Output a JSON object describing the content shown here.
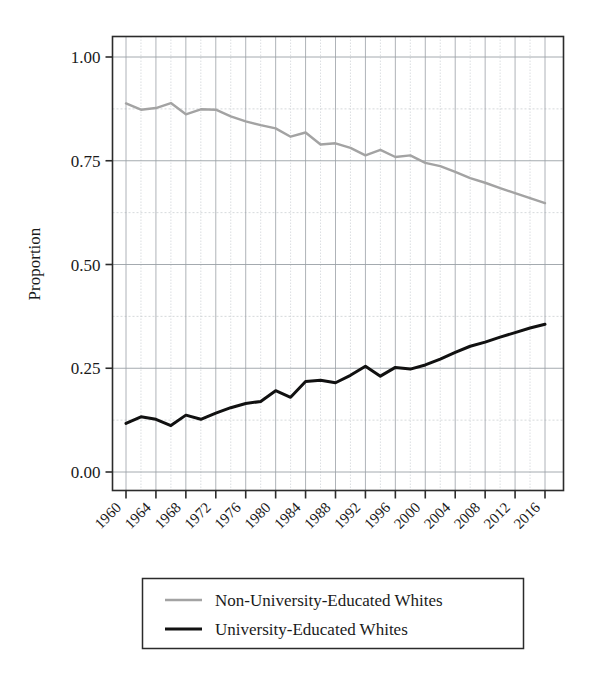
{
  "chart_data": {
    "type": "line",
    "title": "",
    "subtitle": "",
    "xlabel": "",
    "ylabel": "Proportion",
    "xlim": [
      1960,
      2016
    ],
    "ylim": [
      0.0,
      1.0
    ],
    "grid": true,
    "grid_major_y": [
      0.0,
      0.25,
      0.5,
      0.75,
      1.0
    ],
    "grid_minor_y": [
      0.125,
      0.375,
      0.625,
      0.875
    ],
    "grid_minor_x_step": 2,
    "legend_position": "bottom",
    "x": [
      1960,
      1962,
      1964,
      1966,
      1968,
      1970,
      1972,
      1974,
      1976,
      1978,
      1980,
      1982,
      1984,
      1986,
      1988,
      1990,
      1992,
      1994,
      1996,
      1998,
      2000,
      2002,
      2004,
      2006,
      2008,
      2010,
      2012,
      2014,
      2016
    ],
    "ytick_labels": [
      "0.00",
      "0.25",
      "0.50",
      "0.75",
      "1.00"
    ],
    "ytick_values": [
      0.0,
      0.25,
      0.5,
      0.75,
      1.0
    ],
    "xtick_labels": [
      "1960",
      "1964",
      "1968",
      "1972",
      "1976",
      "1980",
      "1984",
      "1988",
      "1992",
      "1996",
      "2000",
      "2004",
      "2008",
      "2012",
      "2016"
    ],
    "xtick_values": [
      1960,
      1964,
      1968,
      1972,
      1976,
      1980,
      1984,
      1988,
      1992,
      1996,
      2000,
      2004,
      2008,
      2012,
      2016
    ],
    "series": [
      {
        "name": "Non-University-Educated Whites",
        "color": "#a3a3a3",
        "width": 2.4,
        "values": [
          0.888,
          0.873,
          0.877,
          0.889,
          0.862,
          0.874,
          0.873,
          0.857,
          0.845,
          0.836,
          0.828,
          0.808,
          0.818,
          0.789,
          0.792,
          0.781,
          0.763,
          0.776,
          0.759,
          0.763,
          0.745,
          0.737,
          0.723,
          0.708,
          0.697,
          0.684,
          0.672,
          0.66,
          0.648
        ]
      },
      {
        "name": "University-Educated Whites",
        "color": "#111111",
        "width": 3.0,
        "values": [
          0.117,
          0.133,
          0.127,
          0.112,
          0.137,
          0.127,
          0.142,
          0.155,
          0.165,
          0.17,
          0.196,
          0.18,
          0.218,
          0.221,
          0.215,
          0.233,
          0.255,
          0.231,
          0.252,
          0.248,
          0.258,
          0.272,
          0.288,
          0.303,
          0.313,
          0.325,
          0.336,
          0.347,
          0.356
        ]
      }
    ]
  },
  "legend": {
    "items": [
      {
        "label": "Non-University-Educated Whites",
        "color": "#a3a3a3",
        "width": 2.4
      },
      {
        "label": "University-Educated Whites",
        "color": "#111111",
        "width": 3.0
      }
    ]
  },
  "axes": {
    "y_title": "Proportion"
  },
  "style": {
    "background": "#ffffff",
    "frame_color": "#2b2b2b",
    "grid_major_color": "#9aa0a6",
    "grid_minor_color": "#c3c8cc",
    "text_color": "#1a1a1a"
  }
}
